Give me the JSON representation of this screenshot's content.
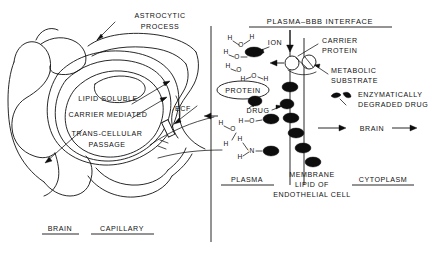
{
  "figure": {
    "kind": "blood-brain-barrier-schematic",
    "background_color": "#ffffff",
    "ink_color": "#111111",
    "width": 432,
    "height": 265
  },
  "left_panel": {
    "name": "brain-capillary-cross-section",
    "labels": {
      "astrocytic_process": "ASTROCYTIC\nPROCESS",
      "astrocytic_process_line1": "ASTROCYTIC",
      "astrocytic_process_line2": "PROCESS",
      "lipid_soluble": "LIPID SOLUBLE",
      "carrier_mediated": "CARRIER  MEDIATED",
      "trans_cellular_line1": "TRANS-CELLULAR",
      "trans_cellular_line2": "PASSAGE",
      "ecf": "ECF",
      "footer_brain": "BRAIN",
      "footer_capillary": "CAPILLARY"
    }
  },
  "right_panel": {
    "name": "plasma-bbb-interface-detail",
    "title": "PLASMA–BBB   INTERFACE",
    "labels": {
      "ion": "ION",
      "protein": "PROTEIN",
      "drug": "DRUG",
      "carrier_protein_line1": "CARRIER",
      "carrier_protein_line2": "PROTEIN",
      "metabolic_substrate_line1": "METABOLIC",
      "metabolic_substrate_line2": "SUBSTRATE",
      "enzymatically_degraded_line1": "ENZYMATICALLY",
      "enzymatically_degraded_line2": "DEGRADED  DRUG",
      "brain_arrow": "BRAIN",
      "footer_plasma": "PLASMA",
      "footer_membrane_line1": "MEMBRANE",
      "footer_membrane_line2": "LIPID OF",
      "footer_membrane_line3": "ENDOTHELIAL  CELL",
      "footer_cytoplasm": "CYTOPLASM"
    },
    "atoms": {
      "hydrogen": "H",
      "oxygen": "O",
      "nitrogen": "N"
    }
  }
}
